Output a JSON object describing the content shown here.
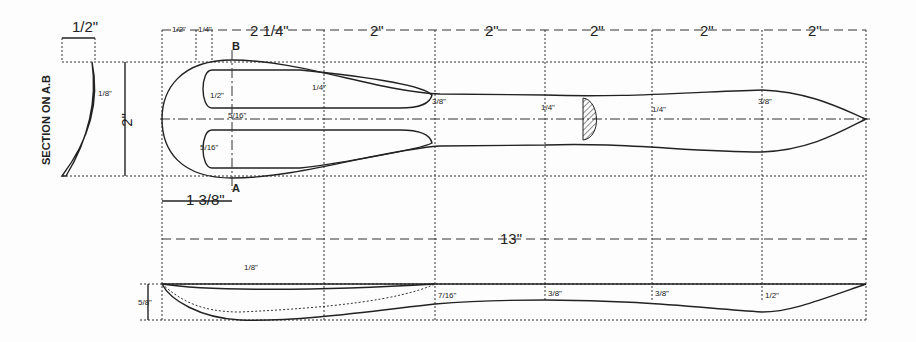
{
  "section_label": "SECTION ON A.B",
  "section_dims": {
    "width": "1/2\"",
    "thickness": "1/8\""
  },
  "top_dims": [
    "1/2\"",
    "1/4\"",
    "2 1/4\"",
    "2\"",
    "2\"",
    "2\"",
    "2\"",
    "2\""
  ],
  "overall_width": "2\"",
  "overall_length": "13\"",
  "offset_a": "1 3/8\"",
  "section_markers": {
    "a": "A",
    "b": "B"
  },
  "plan_dims": [
    "1/4\"",
    "3/8\"",
    "1/4\"",
    "1/4\"",
    "3/8\"",
    "5/16\"",
    "5/16\"",
    "1/2\""
  ],
  "elevation_dims": {
    "depth": "5/8\"",
    "bowl": "1/8\"",
    "stations": [
      "7/16\"",
      "3/8\"",
      "3/8\"",
      "1/2\""
    ]
  }
}
